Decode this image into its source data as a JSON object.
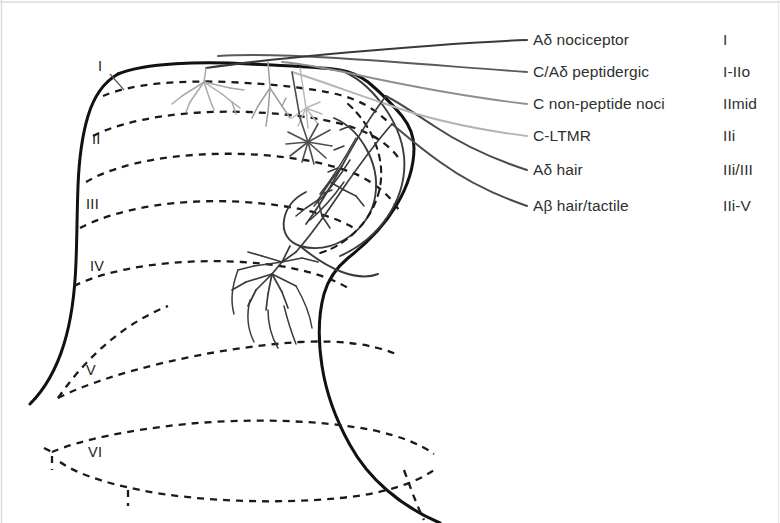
{
  "figure": {
    "background_color": "#ffffff",
    "width": 780,
    "height": 523
  },
  "legend": {
    "rows": [
      {
        "afferent": "Aδ nociceptor",
        "lamina": "I",
        "fiber_color": "#3a3a3a",
        "row_y": 40
      },
      {
        "afferent": "C/Aδ peptidergic",
        "lamina": "I-IIo",
        "fiber_color": "#5a5a5a",
        "row_y": 72
      },
      {
        "afferent": "C non-peptide noci",
        "lamina": "IImid",
        "fiber_color": "#8e8e8e",
        "row_y": 104
      },
      {
        "afferent": "C-LTMR",
        "lamina": "IIi",
        "fiber_color": "#b4b4b4",
        "row_y": 136
      },
      {
        "afferent": "Aδ hair",
        "lamina": "IIi/III",
        "fiber_color": "#4a4a4a",
        "row_y": 170
      },
      {
        "afferent": "Aβ hair/tactile",
        "lamina": "IIi-V",
        "fiber_color": "#4a4a4a",
        "row_y": 206
      }
    ]
  },
  "laminae": [
    {
      "label": "I",
      "x": 98,
      "y": 58
    },
    {
      "label": "II",
      "x": 92,
      "y": 131
    },
    {
      "label": "III",
      "x": 86,
      "y": 196
    },
    {
      "label": "IV",
      "x": 90,
      "y": 258
    },
    {
      "label": "V",
      "x": 86,
      "y": 362
    },
    {
      "label": "VI",
      "x": 88,
      "y": 444
    }
  ],
  "style": {
    "outline_color": "#111111",
    "dashed_color": "#1a1a1a",
    "neuron_color": "#3b3b3b",
    "arbor_light_color": "#a9a9a9",
    "frame_color": "#d8d8d8",
    "text_color": "#2f2f2f"
  }
}
